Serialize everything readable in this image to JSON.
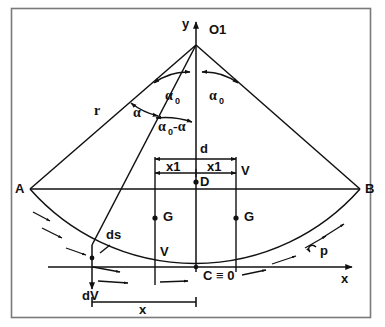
{
  "figure": {
    "kind": "geometry-diagram",
    "title_text": "",
    "frame": {
      "border_color": "#6b6b6b",
      "background": "#ffffff"
    },
    "stroke_color": "#111111",
    "points": {
      "apex": {
        "label": "O1",
        "x": 196,
        "y": 45
      },
      "left_end": {
        "label": "A",
        "x": 30,
        "y": 189
      },
      "right_end": {
        "label": "B",
        "x": 360,
        "y": 189
      },
      "center_node": {
        "label": "D",
        "x": 196,
        "y": 182
      },
      "origin_node": {
        "label": "C ≡ 0",
        "x": 196,
        "y": 267
      }
    },
    "axes": {
      "y_label": "y",
      "x_label": "x"
    },
    "angles": {
      "alpha_zero_left": "α",
      "alpha_zero_left_sub": "0",
      "alpha_zero_right": "α",
      "alpha_zero_right_sub": "0",
      "alpha": "α",
      "alpha_diff_main": "α",
      "alpha_diff_sub": "0",
      "alpha_diff_tail": "-α"
    },
    "labels": {
      "radius": "r",
      "width_total": "d",
      "half_width_left": "x1",
      "half_width_right": "x1",
      "velocity_right": "V",
      "velocity_left": "V",
      "weight_left": "G",
      "weight_right": "G",
      "arc_element": "ds",
      "delta_velocity": "dV",
      "pressure": "p",
      "horizontal_distance": "x"
    }
  }
}
